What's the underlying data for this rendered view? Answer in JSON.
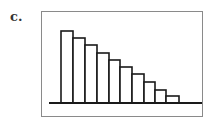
{
  "figure": {
    "panel_label": "c."
  },
  "chart_data": {
    "type": "bar",
    "title": "",
    "xlabel": "",
    "ylabel": "",
    "categories": [
      "1",
      "2",
      "3",
      "4",
      "5",
      "6",
      "7",
      "8",
      "9",
      "10"
    ],
    "values": [
      72,
      65,
      58,
      50,
      43,
      36,
      29,
      21,
      13,
      7
    ],
    "value_units": "relative bar height (no axis scale shown)",
    "shape": "decreasing histogram (right-skewed)",
    "grid": false,
    "legend": null,
    "bar_fill": "#ffffff",
    "bar_stroke": "#1a1a1a"
  },
  "layout": {
    "baseline_y": 103,
    "baseline_x1": 49,
    "baseline_x2": 202,
    "bar_left": [
      61,
      73,
      85,
      97,
      109,
      120,
      132,
      144,
      155,
      166
    ],
    "bar_right_end": 179
  }
}
